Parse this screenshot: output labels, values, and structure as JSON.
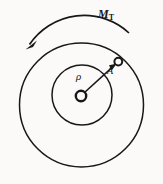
{
  "figure": {
    "type": "mechanical-diagram",
    "canvas": {
      "width": 163,
      "height": 184
    },
    "background_color": "#fbfaf8",
    "stroke_color": "#18181a",
    "labels": {
      "torque_symbol": "M",
      "torque_subscript": "T",
      "radius_symbol": "ρ",
      "point_symbol": "A"
    },
    "geometry": {
      "outer_circle": {
        "cx": 81.5,
        "cy": 105,
        "r": 62
      },
      "inner_circle": {
        "cx": 82,
        "cy": 95,
        "r": 30
      },
      "center_hub": {
        "cx": 81,
        "cy": 96,
        "r": 5.5
      },
      "point_a": {
        "cx": 118,
        "cy": 62,
        "r": 4
      },
      "radius_line": {
        "x1": 85,
        "y1": 92,
        "x2": 115,
        "y2": 65
      },
      "torque_arc": {
        "start": {
          "x": 28,
          "y": 44
        },
        "end": {
          "x": 129,
          "y": 33
        },
        "sweep": "counterclockwise",
        "arrow_at": "start"
      }
    }
  }
}
